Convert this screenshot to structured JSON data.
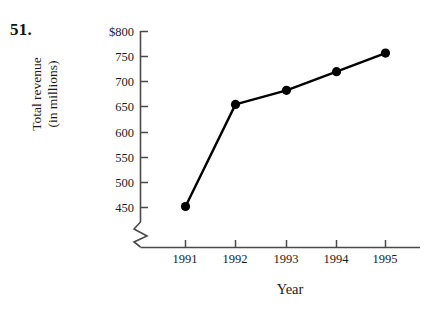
{
  "problem": {
    "number": "51."
  },
  "chart_data": {
    "type": "line",
    "title": "",
    "xlabel": "Year",
    "ylabel": "Total revenue (in millions)",
    "ylabel_line1": "Total revenue",
    "ylabel_line2": "(in millions)",
    "categories": [
      "1991",
      "1992",
      "1993",
      "1994",
      "1995"
    ],
    "values": [
      452,
      655,
      683,
      720,
      757
    ],
    "x": [
      1991,
      1992,
      1993,
      1994,
      1995
    ],
    "ytick_labels": [
      "$800",
      "750",
      "700",
      "650",
      "600",
      "550",
      "500",
      "450"
    ],
    "ytick_values": [
      800,
      750,
      700,
      650,
      600,
      550,
      500,
      450
    ],
    "ylim": [
      450,
      800
    ],
    "axis_break": true,
    "grid": false,
    "legend": null,
    "marker": "filled-circle",
    "line_color": "#000000",
    "marker_color": "#000000",
    "axis_color": "#4a4a4a"
  }
}
